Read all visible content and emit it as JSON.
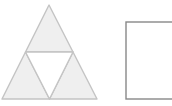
{
  "canvas": {
    "width": 172,
    "height": 106,
    "background": "#ffffff"
  },
  "style": {
    "triangle_fill": "#efefef",
    "triangle_stroke": "#c4c4c4",
    "triangle_stroke_width": 1.4,
    "hole_fill": "#ffffff",
    "rect_fill": "#ffffff",
    "rect_stroke": "#888888",
    "rect_stroke_width": 1.4
  },
  "shapes": {
    "sierpinski": {
      "label": "sierpinski-triangle-stage-1",
      "apex": {
        "x": 49,
        "y": 5
      },
      "base_left": {
        "x": 2,
        "y": 99
      },
      "base_right": {
        "x": 97,
        "y": 99
      },
      "midpoint_left": {
        "x": 25.5,
        "y": 52
      },
      "midpoint_right": {
        "x": 73,
        "y": 52
      },
      "midpoint_base": {
        "x": 49.5,
        "y": 99
      },
      "sub_triangles": [
        {
          "name": "top-sub-triangle",
          "points": "49,5 25.5,52 73,52"
        },
        {
          "name": "bottom-left-sub-triangle",
          "points": "25.5,52 2,99 49.5,99"
        },
        {
          "name": "bottom-right-sub-triangle",
          "points": "73,52 49.5,99 97,99"
        }
      ],
      "hole": {
        "name": "center-inverted-triangle",
        "points": "25.5,52 73,52 49.5,99"
      }
    },
    "rectangle": {
      "label": "empty-rectangle",
      "x": 126,
      "y": 22,
      "width": 52,
      "height": 77,
      "clipped_right": true
    }
  }
}
